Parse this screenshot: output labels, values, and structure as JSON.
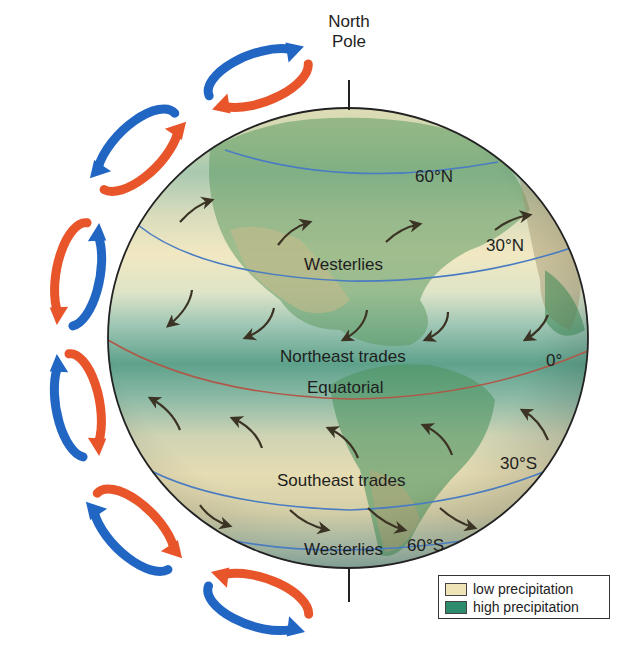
{
  "figure": {
    "pole_label_line1": "North",
    "pole_label_line2": "Pole"
  },
  "latitudes": {
    "lat_60n": "60°N",
    "lat_30n": "30°N",
    "lat_0": "0°",
    "lat_30s": "30°S",
    "lat_60s": "60°S"
  },
  "wind_belts": {
    "westerlies_north": "Westerlies",
    "northeast_trades": "Northeast trades",
    "equatorial": "Equatorial",
    "southeast_trades": "Southeast trades",
    "westerlies_south": "Westerlies"
  },
  "legend": {
    "items": [
      {
        "label": "low precipitation",
        "color": "#efe3b8"
      },
      {
        "label": "high precipitation",
        "color": "#2e8c6e"
      }
    ]
  },
  "colors": {
    "cell_warm": "#e8552b",
    "cell_cool": "#2266c4",
    "latitude_line": "#4a7cc2",
    "equator_line": "#b05848",
    "wind_arrow": "#3b3324",
    "globe_outline": "#222222"
  }
}
